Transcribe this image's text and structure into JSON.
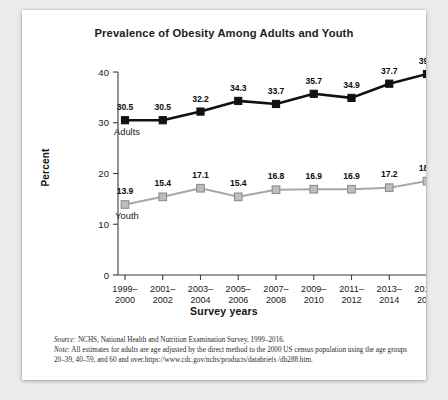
{
  "card": {
    "title": "Prevalence of Obesity Among Adults and Youth"
  },
  "footnote": {
    "source_label": "Source:",
    "source_text": " NCHS, National Health and Nutrition Examination Survey, 1999–2016.",
    "note_label": "Note:",
    "note_text": " All estimates for adults are age adjusted by the direct method to the 2000 US census population using the age groups 20–39, 40–59, and 60 and over.https://www.cdc.gov/nchs/products/databriefs /db288.htm."
  },
  "chart_data": {
    "type": "line",
    "title": "Prevalence of Obesity Among Adults and Youth",
    "xlabel": "Survey years",
    "ylabel": "Percent",
    "ylim": [
      0,
      40
    ],
    "yticks": [
      0,
      10,
      20,
      30,
      40
    ],
    "ytick_labels": [
      "0",
      "10",
      "20",
      "30",
      "40"
    ],
    "grid": false,
    "legend": "inline-labels",
    "categories": [
      "1999–2000",
      "2001–2002",
      "2003–2004",
      "2005–2006",
      "2007–2008",
      "2009–2010",
      "2011–2012",
      "2013–2014",
      "2015–2016"
    ],
    "category_lines": [
      [
        "1999–",
        "2000"
      ],
      [
        "2001–",
        "2002"
      ],
      [
        "2003–",
        "2004"
      ],
      [
        "2005–",
        "2006"
      ],
      [
        "2007–",
        "2008"
      ],
      [
        "2009–",
        "2010"
      ],
      [
        "2011–",
        "2012"
      ],
      [
        "2013–",
        "2014"
      ],
      [
        "2015–",
        "2016"
      ]
    ],
    "series": [
      {
        "name": "Adults",
        "color": "#111111",
        "marker": "square-filled-black",
        "values": [
          30.5,
          30.5,
          32.2,
          34.3,
          33.7,
          35.7,
          34.9,
          37.7,
          39.6
        ],
        "labels": [
          "30.5",
          "30.5",
          "32.2",
          "34.3",
          "33.7",
          "35.7",
          "34.9",
          "37.7",
          "39.6"
        ]
      },
      {
        "name": "Youth",
        "color": "#a8a8a8",
        "marker": "square-gray",
        "values": [
          13.9,
          15.4,
          17.1,
          15.4,
          16.8,
          16.9,
          16.9,
          17.2,
          18.5
        ],
        "labels": [
          "13.9",
          "15.4",
          "17.1",
          "15.4",
          "16.8",
          "16.9",
          "16.9",
          "17.2",
          "18.5"
        ]
      }
    ]
  }
}
